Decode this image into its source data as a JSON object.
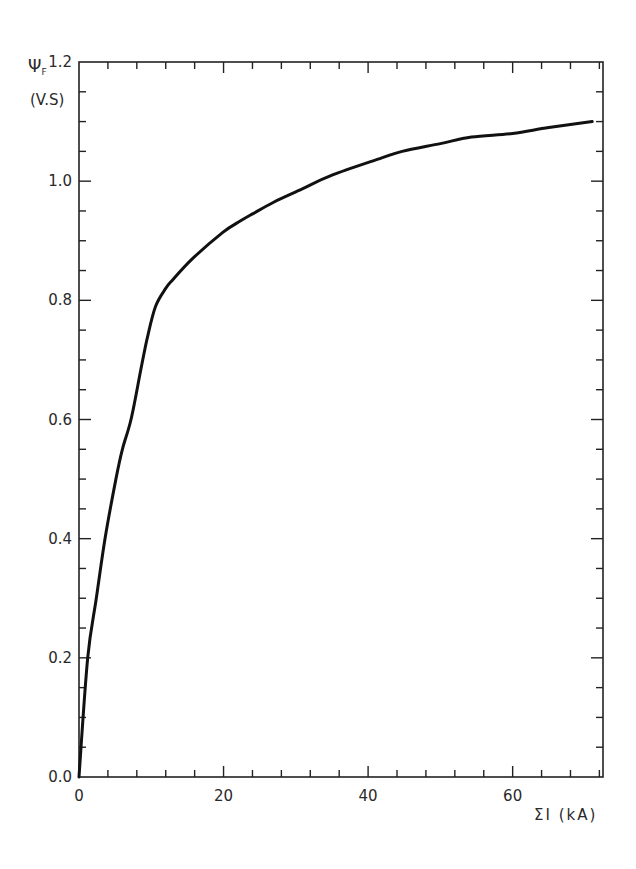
{
  "chart_data": {
    "type": "line",
    "title": "",
    "xlabel": "ΣI (kA)",
    "ylabel_symbol": "Ψ",
    "ylabel_subscript": "F",
    "ylabel_unit": "(V.S)",
    "xlim": [
      0,
      72.5
    ],
    "ylim": [
      0.0,
      1.2
    ],
    "x_ticks_major": [
      0,
      20,
      40,
      60
    ],
    "x_tick_labels": [
      "0",
      "20",
      "40",
      "60"
    ],
    "x_minor_step": 4,
    "y_ticks_major": [
      0.0,
      0.2,
      0.4,
      0.6,
      0.8,
      1.0,
      1.2
    ],
    "y_tick_labels": [
      "0.0",
      "0.2",
      "0.4",
      "0.6",
      "0.8",
      "1.0",
      "1.2"
    ],
    "y_minor_step": 0.05,
    "grid": false,
    "legend": null,
    "series": [
      {
        "name": "ΨF vs ΣI",
        "x": [
          0,
          1.2,
          2.4,
          3.6,
          5.1,
          6.0,
          7.2,
          8.5,
          9.5,
          10.6,
          12.0,
          13.0,
          15.7,
          19.9,
          22.3,
          24.0,
          27.0,
          30.9,
          35.0,
          41.9,
          44.7,
          50.0,
          54.3,
          60.0,
          65.0,
          71.0
        ],
        "y": [
          0.0,
          0.2,
          0.3,
          0.4,
          0.5,
          0.55,
          0.6,
          0.68,
          0.74,
          0.79,
          0.82,
          0.835,
          0.87,
          0.914,
          0.933,
          0.945,
          0.965,
          0.987,
          1.01,
          1.039,
          1.05,
          1.063,
          1.074,
          1.08,
          1.09,
          1.1
        ]
      }
    ]
  },
  "plot": {
    "left_px": 79,
    "right_px": 603,
    "top_px": 62,
    "bottom_px": 777,
    "line_color": "#111111",
    "axis_color": "#222222"
  }
}
